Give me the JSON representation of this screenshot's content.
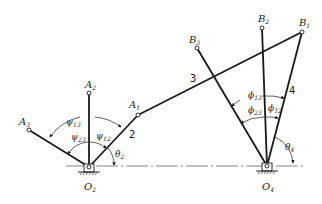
{
  "diagram": {
    "type": "four-bar linkage three-position synthesis",
    "colors": {
      "ink": "#1a1a1a",
      "background": "#ffffff"
    },
    "pivots": {
      "O2": {
        "label": "O",
        "sub": "2",
        "x": 89,
        "y": 167
      },
      "O4": {
        "label": "O",
        "sub": "4",
        "x": 267,
        "y": 166
      }
    },
    "points": {
      "A1": {
        "label": "A",
        "sub": "1",
        "x": 138,
        "y": 115
      },
      "A2": {
        "label": "A",
        "sub": "2",
        "x": 89,
        "y": 93
      },
      "A3": {
        "label": "A",
        "sub": "3",
        "x": 29,
        "y": 130
      },
      "B1": {
        "label": "B",
        "sub": "1",
        "x": 302,
        "y": 32
      },
      "B2": {
        "label": "B",
        "sub": "2",
        "x": 262,
        "y": 28
      },
      "B3": {
        "label": "B",
        "sub": "3",
        "x": 197,
        "y": 48
      }
    },
    "link_labels": {
      "link2": "2",
      "link3": "3",
      "link4": "4"
    },
    "angles": {
      "psi13": {
        "symbol": "ψ",
        "sub": "13"
      },
      "psi23": {
        "symbol": "ψ",
        "sub": "23"
      },
      "psi12": {
        "symbol": "ψ",
        "sub": "12"
      },
      "theta2": {
        "symbol": "θ",
        "sub": "2"
      },
      "phi13": {
        "symbol": "ϕ",
        "sub": "13"
      },
      "phi23": {
        "symbol": "ϕ",
        "sub": "23"
      },
      "phi12": {
        "symbol": "ϕ",
        "sub": "12"
      },
      "theta4": {
        "symbol": "θ",
        "sub": "4"
      }
    }
  }
}
